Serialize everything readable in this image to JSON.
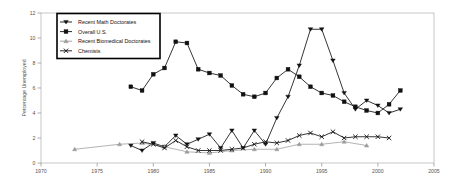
{
  "chart_data": {
    "type": "line",
    "title": "",
    "xlabel": "",
    "ylabel": "Percentage Unemployed",
    "xlim": [
      1970,
      2005
    ],
    "ylim": [
      0,
      12
    ],
    "xticks": [
      1970,
      1975,
      1980,
      1985,
      1990,
      1995,
      2000,
      2005
    ],
    "yticks": [
      0,
      2,
      4,
      6,
      8,
      10,
      12
    ],
    "grid": false,
    "legend_position": "upper-left-inset",
    "series": [
      {
        "name": "Recent Math Doctorates",
        "marker": "triangle-down",
        "color": "#111111",
        "points": [
          [
            1978.0,
            1.4
          ],
          [
            1979.0,
            1.0
          ],
          [
            1980.0,
            1.6
          ],
          [
            1981.0,
            1.3
          ],
          [
            1982.0,
            2.2
          ],
          [
            1983.0,
            1.5
          ],
          [
            1984.0,
            1.9
          ],
          [
            1985.0,
            2.3
          ],
          [
            1986.0,
            1.2
          ],
          [
            1987.0,
            2.6
          ],
          [
            1988.0,
            1.2
          ],
          [
            1989.0,
            2.6
          ],
          [
            1990.0,
            1.5
          ],
          [
            1991.0,
            3.6
          ],
          [
            1992.0,
            5.3
          ],
          [
            1993.0,
            7.8
          ],
          [
            1994.0,
            10.7
          ],
          [
            1995.0,
            10.7
          ],
          [
            1996.0,
            8.2
          ],
          [
            1997.0,
            5.6
          ],
          [
            1998.0,
            4.3
          ],
          [
            1999.0,
            5.0
          ],
          [
            2000.0,
            4.6
          ],
          [
            2001.0,
            4.0
          ],
          [
            2002.0,
            4.3
          ]
        ]
      },
      {
        "name": "Overall U.S.",
        "marker": "square",
        "color": "#111111",
        "points": [
          [
            1978.0,
            6.1
          ],
          [
            1979.0,
            5.8
          ],
          [
            1980.0,
            7.1
          ],
          [
            1981.0,
            7.6
          ],
          [
            1982.0,
            9.7
          ],
          [
            1983.0,
            9.6
          ],
          [
            1984.0,
            7.5
          ],
          [
            1985.0,
            7.2
          ],
          [
            1986.0,
            7.0
          ],
          [
            1987.0,
            6.2
          ],
          [
            1988.0,
            5.5
          ],
          [
            1989.0,
            5.3
          ],
          [
            1990.0,
            5.6
          ],
          [
            1991.0,
            6.8
          ],
          [
            1992.0,
            7.5
          ],
          [
            1993.0,
            6.9
          ],
          [
            1994.0,
            6.1
          ],
          [
            1995.0,
            5.6
          ],
          [
            1996.0,
            5.4
          ],
          [
            1997.0,
            4.9
          ],
          [
            1998.0,
            4.5
          ],
          [
            1999.0,
            4.2
          ],
          [
            2000.0,
            4.0
          ],
          [
            2001.0,
            4.7
          ],
          [
            2002.0,
            5.8
          ]
        ]
      },
      {
        "name": "Recent Biomedical Doctorates",
        "marker": "triangle-gray",
        "color": "#9a9a9a",
        "points": [
          [
            1973.0,
            1.1
          ],
          [
            1977.0,
            1.5
          ],
          [
            1979.0,
            1.6
          ],
          [
            1981.0,
            1.3
          ],
          [
            1983.0,
            0.9
          ],
          [
            1985.0,
            0.8
          ],
          [
            1987.0,
            1.0
          ],
          [
            1989.0,
            1.1
          ],
          [
            1991.0,
            1.1
          ],
          [
            1993.0,
            1.5
          ],
          [
            1995.0,
            1.5
          ],
          [
            1997.0,
            1.7
          ],
          [
            1999.0,
            1.4
          ]
        ]
      },
      {
        "name": "Chemists",
        "marker": "x",
        "color": "#111111",
        "points": [
          [
            1979.0,
            1.7
          ],
          [
            1980.0,
            1.5
          ],
          [
            1981.0,
            1.2
          ],
          [
            1982.0,
            1.8
          ],
          [
            1983.0,
            1.3
          ],
          [
            1984.0,
            1.0
          ],
          [
            1985.0,
            1.0
          ],
          [
            1986.0,
            1.0
          ],
          [
            1987.0,
            1.1
          ],
          [
            1988.0,
            1.2
          ],
          [
            1989.0,
            1.5
          ],
          [
            1990.0,
            1.7
          ],
          [
            1991.0,
            1.6
          ],
          [
            1992.0,
            1.8
          ],
          [
            1993.0,
            2.2
          ],
          [
            1994.0,
            2.4
          ],
          [
            1995.0,
            2.1
          ],
          [
            1996.0,
            2.5
          ],
          [
            1997.0,
            2.0
          ],
          [
            1998.0,
            2.1
          ],
          [
            1999.0,
            2.1
          ],
          [
            2000.0,
            2.1
          ],
          [
            2001.0,
            2.0
          ]
        ]
      }
    ]
  },
  "legend": {
    "items": [
      {
        "label": "Recent Math Doctorates",
        "marker": "triangle-down"
      },
      {
        "label": "Overall U.S.",
        "marker": "square"
      },
      {
        "label": "Recent Biomedical Doctorates",
        "marker": "triangle-gray"
      },
      {
        "label": "Chemists",
        "marker": "x"
      }
    ]
  },
  "axes": {
    "y_title": "Percentage Unemployed",
    "x_tick_labels": [
      "1970",
      "1975",
      "1980",
      "1985",
      "1990",
      "1995",
      "2000",
      "2005"
    ],
    "y_tick_labels": [
      "0",
      "2",
      "4",
      "6",
      "8",
      "10",
      "12"
    ]
  }
}
